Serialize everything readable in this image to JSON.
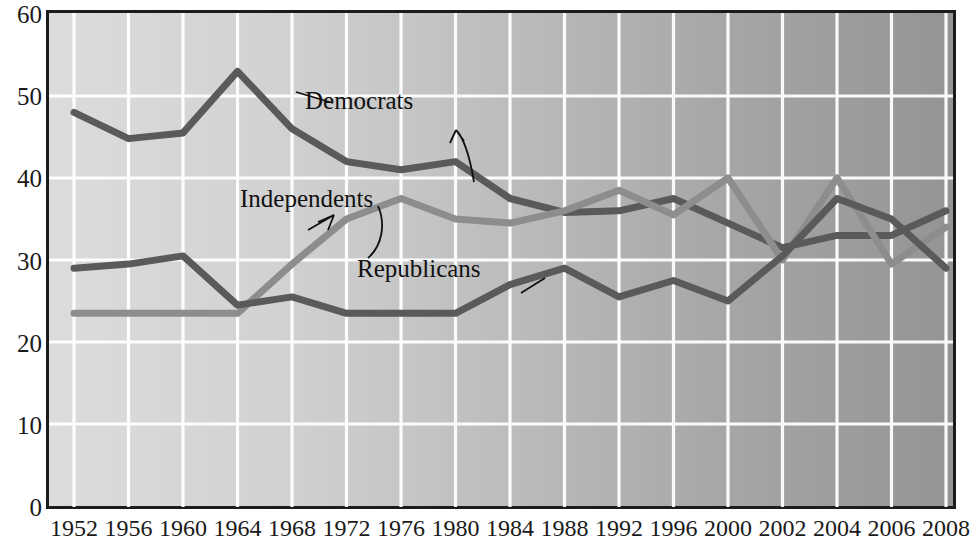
{
  "chart_data": {
    "type": "line",
    "title": "",
    "xlabel": "",
    "ylabel": "",
    "ylim": [
      0,
      60
    ],
    "yticks": [
      0,
      10,
      20,
      30,
      40,
      50,
      60
    ],
    "grid": true,
    "legend_position": "inline-annotations",
    "categories": [
      "1952",
      "1956",
      "1960",
      "1964",
      "1968",
      "1972",
      "1976",
      "1980",
      "1984",
      "1988",
      "1992",
      "1996",
      "2000",
      "2002",
      "2004",
      "2006",
      "2008"
    ],
    "series": [
      {
        "name": "Democrats",
        "color": "#5a5a5a",
        "values": [
          48.0,
          44.8,
          45.5,
          53.0,
          46.0,
          42.0,
          41.0,
          42.0,
          37.5,
          35.8,
          36.0,
          37.5,
          34.5,
          31.5,
          33.0,
          33.0,
          36.0
        ]
      },
      {
        "name": "Independents",
        "color": "#8d8d8d",
        "values": [
          23.5,
          23.5,
          23.5,
          23.5,
          29.5,
          35.0,
          37.5,
          35.0,
          34.5,
          36.0,
          38.5,
          35.5,
          40.0,
          30.0,
          40.0,
          29.5,
          34.0
        ]
      },
      {
        "name": "Republicans",
        "color": "#5a5a5a",
        "values": [
          29.0,
          29.5,
          30.5,
          24.5,
          25.5,
          23.5,
          23.5,
          23.5,
          27.0,
          29.0,
          25.5,
          27.5,
          25.0,
          30.5,
          37.5,
          35.0,
          29.0
        ]
      }
    ],
    "annotations": [
      {
        "label": "Democrats",
        "series": "Democrats"
      },
      {
        "label": "Independents",
        "series": "Independents"
      },
      {
        "label": "Republicans",
        "series": "Republicans"
      }
    ],
    "background": {
      "gradient_from": "#d9d9d9",
      "gradient_to": "#969696",
      "gridline_color": "#ffffff",
      "border_color": "#1c1c1c"
    }
  },
  "axis": {
    "y_ticks": [
      "60",
      "50",
      "40",
      "30",
      "20",
      "10",
      "0"
    ],
    "x_ticks": [
      "1952",
      "1956",
      "1960",
      "1964",
      "1968",
      "1972",
      "1976",
      "1980",
      "1984",
      "1988",
      "1992",
      "1996",
      "2000",
      "2002",
      "2004",
      "2006",
      "2008"
    ]
  },
  "labels": {
    "democrats": "Democrats",
    "independents": "Independents",
    "republicans": "Republicans"
  }
}
